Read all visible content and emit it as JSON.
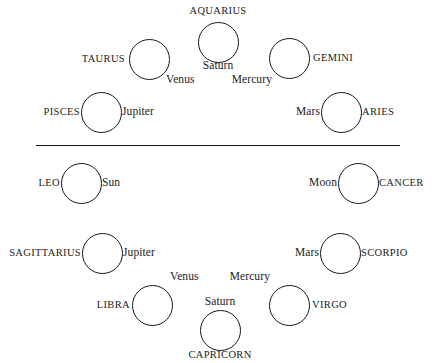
{
  "diagram": {
    "divider": {
      "name": "horizontal-divider"
    },
    "style": {
      "stroke_color": "#16161c",
      "text_color": "#1b1b22",
      "background_color": "#ffffff"
    },
    "nodes": [
      {
        "id": "aquarius",
        "sign": "AQUARIUS",
        "planets": [
          "Saturn"
        ],
        "half": "upper",
        "circle": {
          "cx": 218,
          "cy": 42,
          "r": 20.5
        },
        "sign_label": {
          "x": 218,
          "y": 11,
          "anchor": "center"
        },
        "planet_labels": [
          {
            "text": "Saturn",
            "x": 218,
            "y": 66,
            "anchor": "center"
          }
        ]
      },
      {
        "id": "taurus",
        "sign": "TAURUS",
        "planets": [
          "Venus"
        ],
        "half": "upper",
        "circle": {
          "cx": 149,
          "cy": 59,
          "r": 20.5
        },
        "sign_label": {
          "x": 125,
          "y": 59,
          "anchor": "right"
        },
        "planet_labels": [
          {
            "text": "Venus",
            "x": 166,
            "y": 80,
            "anchor": "left"
          }
        ]
      },
      {
        "id": "gemini",
        "sign": "GEMINI",
        "planets": [
          "Mercury"
        ],
        "half": "upper",
        "circle": {
          "cx": 289,
          "cy": 58,
          "r": 20.5
        },
        "sign_label": {
          "x": 313,
          "y": 58,
          "anchor": "left"
        },
        "planet_labels": [
          {
            "text": "Mercury",
            "x": 272,
            "y": 80,
            "anchor": "right"
          }
        ]
      },
      {
        "id": "pisces",
        "sign": "PISCES",
        "planets": [
          "Jupiter"
        ],
        "half": "upper",
        "circle": {
          "cx": 101,
          "cy": 112,
          "r": 20.5
        },
        "sign_label": {
          "x": 80,
          "y": 112,
          "anchor": "right"
        },
        "planet_labels": [
          {
            "text": "Jupiter",
            "x": 122,
            "y": 112,
            "anchor": "left"
          }
        ]
      },
      {
        "id": "aries",
        "sign": "ARIES",
        "planets": [
          "Mars"
        ],
        "half": "upper",
        "circle": {
          "cx": 341,
          "cy": 112,
          "r": 20.5
        },
        "sign_label": {
          "x": 362,
          "y": 112,
          "anchor": "left"
        },
        "planet_labels": [
          {
            "text": "Mars",
            "x": 320,
            "y": 112,
            "anchor": "right"
          }
        ]
      },
      {
        "id": "leo",
        "sign": "LEO",
        "planets": [
          "Sun"
        ],
        "half": "lower",
        "circle": {
          "cx": 81,
          "cy": 183,
          "r": 20.5
        },
        "sign_label": {
          "x": 60,
          "y": 183,
          "anchor": "right"
        },
        "planet_labels": [
          {
            "text": "Sun",
            "x": 102,
            "y": 183,
            "anchor": "left"
          }
        ]
      },
      {
        "id": "cancer",
        "sign": "CANCER",
        "planets": [
          "Moon"
        ],
        "half": "lower",
        "circle": {
          "cx": 358,
          "cy": 183,
          "r": 20.5
        },
        "sign_label": {
          "x": 379,
          "y": 183,
          "anchor": "left"
        },
        "planet_labels": [
          {
            "text": "Moon",
            "x": 337,
            "y": 183,
            "anchor": "right"
          }
        ]
      },
      {
        "id": "sagittarius",
        "sign": "SAGITTARIUS",
        "planets": [
          "Jupiter"
        ],
        "half": "lower",
        "circle": {
          "cx": 102,
          "cy": 253,
          "r": 20.5
        },
        "sign_label": {
          "x": 81,
          "y": 253,
          "anchor": "right"
        },
        "planet_labels": [
          {
            "text": "Jupiter",
            "x": 123,
            "y": 253,
            "anchor": "left"
          }
        ]
      },
      {
        "id": "scorpio",
        "sign": "SCORPIO",
        "planets": [
          "Mars"
        ],
        "half": "lower",
        "circle": {
          "cx": 340,
          "cy": 253,
          "r": 20.5
        },
        "sign_label": {
          "x": 361,
          "y": 253,
          "anchor": "left"
        },
        "planet_labels": [
          {
            "text": "Mars",
            "x": 319,
            "y": 253,
            "anchor": "right"
          }
        ]
      },
      {
        "id": "libra",
        "sign": "LIBRA",
        "planets": [
          "Venus"
        ],
        "half": "lower",
        "circle": {
          "cx": 152,
          "cy": 305,
          "r": 20.5
        },
        "sign_label": {
          "x": 130,
          "y": 305,
          "anchor": "right"
        },
        "planet_labels": [
          {
            "text": "Venus",
            "x": 170,
            "y": 277,
            "anchor": "left"
          }
        ]
      },
      {
        "id": "virgo",
        "sign": "VIRGO",
        "planets": [
          "Mercury"
        ],
        "half": "lower",
        "circle": {
          "cx": 289,
          "cy": 305,
          "r": 20.5
        },
        "sign_label": {
          "x": 312,
          "y": 305,
          "anchor": "left"
        },
        "planet_labels": [
          {
            "text": "Mercury",
            "x": 270,
            "y": 277,
            "anchor": "right"
          }
        ]
      },
      {
        "id": "capricorn",
        "sign": "CAPRICORN",
        "planets": [
          "Saturn"
        ],
        "half": "lower",
        "circle": {
          "cx": 220,
          "cy": 330,
          "r": 20.5
        },
        "sign_label": {
          "x": 220,
          "y": 355,
          "anchor": "center"
        },
        "planet_labels": [
          {
            "text": "Saturn",
            "x": 220,
            "y": 302,
            "anchor": "center"
          }
        ]
      }
    ],
    "divider_geometry": {
      "x1": 36,
      "x2": 400,
      "y": 145
    }
  }
}
